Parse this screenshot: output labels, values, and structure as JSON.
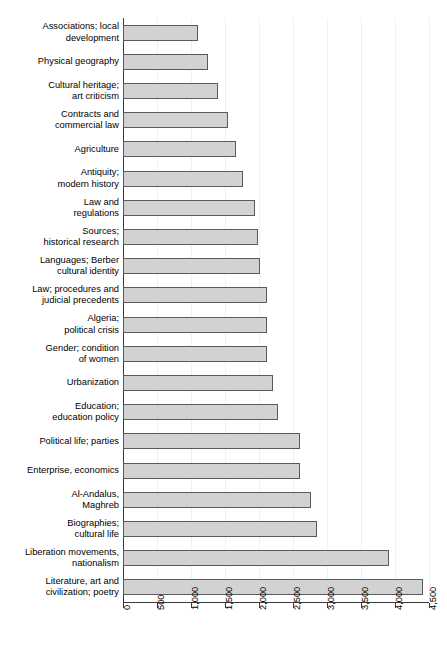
{
  "chart_data": {
    "type": "bar",
    "orientation": "horizontal",
    "title": "",
    "subtitle": "",
    "xlabel": "",
    "ylabel": "",
    "xlim": [
      0,
      4500
    ],
    "xticks": [
      0,
      500,
      1000,
      1500,
      2000,
      2500,
      3000,
      3500,
      4000,
      4500
    ],
    "xtick_labels": [
      "0",
      "500",
      "1,000",
      "1,500",
      "2,000",
      "2,500",
      "3,000",
      "3,500",
      "4,000",
      "4,500"
    ],
    "grid": "vertical",
    "legend": "none",
    "bar_fill_color": "#d2d2d2",
    "bar_edge_color": "#5a5a5a",
    "axis_color": "#3a3a3a",
    "gridline_color": "#f0f0f0",
    "categories": [
      "Associations; local\ndevelopment",
      "Physical geography",
      "Cultural heritage;\nart criticism",
      "Contracts and\ncommercial law",
      "Agriculture",
      "Antiquity;\nmodern history",
      "Law and\nregulations",
      "Sources;\nhistorical research",
      "Languages; Berber\ncultural identity",
      "Law; procedures and\njudicial precedents",
      "Algeria;\npolitical crisis",
      "Gender; condition\nof women",
      "Urbanization",
      "Education;\neducation policy",
      "Political life; parties",
      "Enterprise, economics",
      "Al-Andalus,\nMaghreb",
      "Biographies;\ncultural life",
      "Liberation movements,\nnationalism",
      "Literature, art and\ncivilization; poetry"
    ],
    "values": [
      1110,
      1250,
      1390,
      1540,
      1660,
      1760,
      1940,
      1980,
      2010,
      2115,
      2115,
      2115,
      2200,
      2280,
      2600,
      2600,
      2760,
      2850,
      3915,
      4415
    ]
  }
}
